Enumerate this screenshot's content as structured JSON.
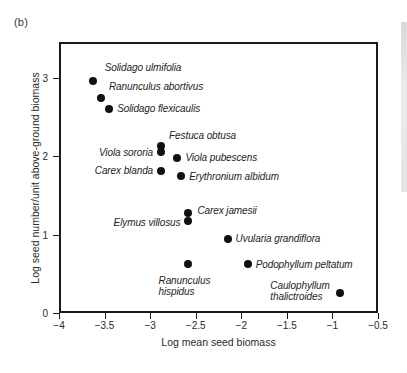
{
  "figure": {
    "panel_label": "(b)"
  },
  "chart_data": {
    "type": "scatter",
    "title": "",
    "xlabel": "Log mean seed biomass",
    "ylabel": "Log seed number/unit above-ground biomass",
    "xlim": [
      -4,
      -0.5
    ],
    "ylim": [
      0,
      3.4
    ],
    "grid": false,
    "legend": "none",
    "xticks": [
      -4,
      -3.5,
      -3,
      -2.5,
      -2,
      -1.5,
      -1,
      -0.5
    ],
    "xtick_labels": [
      "−4",
      "−3.5",
      "−3",
      "−2.5",
      "−2",
      "−1.5",
      "−1",
      "−0.5"
    ],
    "yticks": [
      0,
      1,
      2,
      3
    ],
    "ytick_labels": [
      "0",
      "1",
      "2",
      "3"
    ],
    "points": [
      {
        "label": "Solidago ulmifolia",
        "x": -3.63,
        "y": 2.96,
        "label_pos": "above",
        "dx": 12,
        "dy": -13
      },
      {
        "label": "Ranunculus abortivus",
        "x": -3.54,
        "y": 2.74,
        "label_pos": "right",
        "dx": 8,
        "dy": -11
      },
      {
        "label": "Solidago flexicaulis",
        "x": -3.45,
        "y": 2.6,
        "label_pos": "right",
        "dx": 8,
        "dy": 0
      },
      {
        "label": "Festuca obtusa",
        "x": -2.88,
        "y": 2.13,
        "label_pos": "right",
        "dx": 8,
        "dy": -10
      },
      {
        "label": "Viola sororia",
        "x": -2.88,
        "y": 2.06,
        "label_pos": "left",
        "dx": -8,
        "dy": 1
      },
      {
        "label": "Viola pubescens",
        "x": -2.7,
        "y": 1.98,
        "label_pos": "right",
        "dx": 8,
        "dy": 0
      },
      {
        "label": "Carex blanda",
        "x": -2.88,
        "y": 1.81,
        "label_pos": "left",
        "dx": -8,
        "dy": 0
      },
      {
        "label": "Erythronium albidum",
        "x": -2.66,
        "y": 1.75,
        "label_pos": "right",
        "dx": 8,
        "dy": 1
      },
      {
        "label": "Carex jamesii",
        "x": -2.58,
        "y": 1.28,
        "label_pos": "right",
        "dx": 9,
        "dy": -2
      },
      {
        "label": "Elymus villosus",
        "x": -2.58,
        "y": 1.17,
        "label_pos": "left",
        "dx": -8,
        "dy": 2
      },
      {
        "label": "Uvularia grandiflora",
        "x": -2.15,
        "y": 0.95,
        "label_pos": "right",
        "dx": 8,
        "dy": 0
      },
      {
        "label": "Podophyllum peltatum",
        "x": -1.93,
        "y": 0.63,
        "label_pos": "right",
        "dx": 8,
        "dy": 1
      },
      {
        "label": "Ranunculus\nhispidus",
        "x": -2.58,
        "y": 0.63,
        "label_pos": "below",
        "dx": -4,
        "dy": 11
      },
      {
        "label": "Caulophyllum\nthalictroides",
        "x": -0.92,
        "y": 0.26,
        "label_pos": "left",
        "dx": -10,
        "dy": -2
      }
    ]
  }
}
